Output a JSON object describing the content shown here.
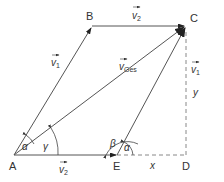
{
  "diagram": {
    "points": {
      "A": {
        "label": "A",
        "x": 14,
        "y": 155
      },
      "B": {
        "label": "B",
        "x": 92,
        "y": 26
      },
      "C": {
        "label": "C",
        "x": 186,
        "y": 26
      },
      "D": {
        "label": "D",
        "x": 186,
        "y": 155
      },
      "E": {
        "label": "E",
        "x": 117,
        "y": 155
      }
    },
    "vectors": {
      "v1_AB": {
        "label": "v",
        "sub": "1",
        "from": "A",
        "to": "B"
      },
      "v2_BC": {
        "label": "v",
        "sub": "2",
        "from": "B",
        "to": "C"
      },
      "vges_AC": {
        "label": "v",
        "sub": "Ges",
        "from": "A",
        "to": "C"
      },
      "v1_EC": {
        "label": "v",
        "sub": "1",
        "from": "E",
        "to": "C"
      },
      "v2_AE": {
        "label": "v",
        "sub": "2",
        "from": "A",
        "to": "E"
      }
    },
    "angles": {
      "alpha_A": "α",
      "gamma_A": "γ",
      "beta_E": "β",
      "alpha_E": "α"
    },
    "dimensions": {
      "x": "x",
      "y": "y"
    },
    "colors": {
      "line": "#555555",
      "arrow": "#222222",
      "dashed": "#888888"
    }
  }
}
